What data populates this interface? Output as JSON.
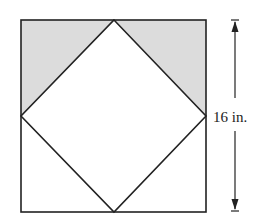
{
  "diagram": {
    "type": "geometry",
    "dimension_label": "16 in.",
    "colors": {
      "stroke": "#222222",
      "shade": "#dcdcdc",
      "background": "#ffffff"
    }
  }
}
